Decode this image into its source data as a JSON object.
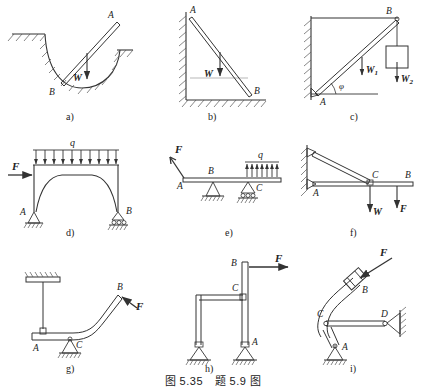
{
  "figure": {
    "caption": "图 5.35　题 5.9 图",
    "caption_figure_number": "图 5.35",
    "caption_problem_number": "题 5.9 图",
    "background_color": "#ffffff",
    "line_color": "#333333",
    "hatch_color": "#555555"
  },
  "panels": [
    {
      "id": "a",
      "label": "a)",
      "description": "rod resting in a curved groove",
      "points": [
        {
          "name": "A",
          "label": "A"
        },
        {
          "name": "B",
          "label": "B"
        }
      ],
      "loads": [
        {
          "name": "W",
          "label": "W",
          "direction": "down"
        }
      ]
    },
    {
      "id": "b",
      "label": "b)",
      "description": "rod leaning against vertical wall and floor",
      "points": [
        {
          "name": "A",
          "label": "A"
        },
        {
          "name": "B",
          "label": "B"
        }
      ],
      "loads": [
        {
          "name": "W",
          "label": "W",
          "direction": "down"
        }
      ]
    },
    {
      "id": "c",
      "label": "c)",
      "description": "inclined bar hinged at wall with hanging weight",
      "points": [
        {
          "name": "A",
          "label": "A"
        },
        {
          "name": "B",
          "label": "B"
        }
      ],
      "angles": [
        {
          "name": "phi",
          "label": "φ"
        }
      ],
      "loads": [
        {
          "name": "W1",
          "label": "W",
          "subscript": "1",
          "direction": "down"
        },
        {
          "name": "W2",
          "label": "W",
          "subscript": "2",
          "direction": "down"
        }
      ]
    },
    {
      "id": "d",
      "label": "d)",
      "description": "portal frame with distributed load and horizontal force",
      "points": [
        {
          "name": "A",
          "label": "A"
        },
        {
          "name": "B",
          "label": "B"
        }
      ],
      "loads": [
        {
          "name": "q",
          "label": "q",
          "direction": "down",
          "type": "distributed"
        },
        {
          "name": "F",
          "label": "F",
          "direction": "right",
          "type": "concentrated"
        }
      ],
      "supports": [
        {
          "at": "A",
          "type": "pin"
        },
        {
          "at": "B",
          "type": "roller"
        }
      ]
    },
    {
      "id": "e",
      "label": "e)",
      "description": "beam on pin and roller with end force and distributed load",
      "points": [
        {
          "name": "A",
          "label": "A"
        },
        {
          "name": "B",
          "label": "B"
        },
        {
          "name": "C",
          "label": "C"
        }
      ],
      "loads": [
        {
          "name": "F",
          "label": "F",
          "direction": "down-right",
          "type": "concentrated"
        },
        {
          "name": "q",
          "label": "q",
          "direction": "down",
          "type": "distributed"
        }
      ],
      "supports": [
        {
          "at": "B",
          "type": "pin"
        },
        {
          "at": "C",
          "type": "roller"
        }
      ]
    },
    {
      "id": "f",
      "label": "f)",
      "description": "bracket: horizontal beam hinged to wall with inclined brace",
      "points": [
        {
          "name": "A",
          "label": "A"
        },
        {
          "name": "B",
          "label": "B"
        },
        {
          "name": "C",
          "label": "C"
        }
      ],
      "loads": [
        {
          "name": "W",
          "label": "W",
          "direction": "down"
        },
        {
          "name": "F",
          "label": "F",
          "direction": "down"
        }
      ]
    },
    {
      "id": "g",
      "label": "g)",
      "description": "bent bar hung by a rod from ceiling, pinned at C, force at B",
      "points": [
        {
          "name": "A",
          "label": "A"
        },
        {
          "name": "B",
          "label": "B"
        },
        {
          "name": "C",
          "label": "C"
        }
      ],
      "loads": [
        {
          "name": "F",
          "label": "F",
          "direction": "down-left"
        }
      ],
      "supports": [
        {
          "at": "C",
          "type": "pin"
        }
      ]
    },
    {
      "id": "h",
      "label": "h)",
      "description": "two columns on pin supports joined by a horizontal link at C",
      "points": [
        {
          "name": "A",
          "label": "A"
        },
        {
          "name": "B",
          "label": "B"
        },
        {
          "name": "C",
          "label": "C"
        }
      ],
      "loads": [
        {
          "name": "F",
          "label": "F",
          "direction": "right"
        }
      ],
      "supports": [
        {
          "at": "A",
          "type": "pin"
        },
        {
          "at": "left-column-base",
          "type": "pin"
        }
      ]
    },
    {
      "id": "i",
      "label": "i)",
      "description": "curved crank pinned at A with link CD to wall, force at B",
      "points": [
        {
          "name": "A",
          "label": "A"
        },
        {
          "name": "B",
          "label": "B"
        },
        {
          "name": "C",
          "label": "C"
        },
        {
          "name": "D",
          "label": "D"
        }
      ],
      "loads": [
        {
          "name": "F",
          "label": "F",
          "direction": "down-left"
        }
      ],
      "supports": [
        {
          "at": "A",
          "type": "pin"
        },
        {
          "at": "D",
          "type": "wall-bracket"
        }
      ]
    }
  ]
}
